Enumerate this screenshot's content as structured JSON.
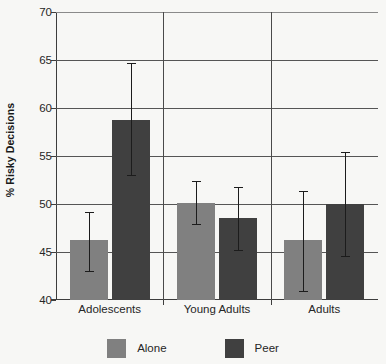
{
  "chart_data": {
    "type": "bar",
    "title": "",
    "xlabel": "",
    "ylabel": "% Risky Decisions",
    "ylim": [
      40,
      70
    ],
    "yticks": [
      40,
      45,
      50,
      55,
      60,
      65,
      70
    ],
    "grid": true,
    "legend_position": "bottom",
    "categories": [
      "Adolescents",
      "Young Adults",
      "Adults"
    ],
    "series": [
      {
        "name": "Alone",
        "color": "#808080",
        "values": [
          46.2,
          50.1,
          46.2
        ],
        "err_low": [
          43.0,
          47.9,
          40.9
        ],
        "err_high": [
          49.2,
          52.4,
          51.4
        ]
      },
      {
        "name": "Peer",
        "color": "#404040",
        "values": [
          58.8,
          48.5,
          50.0
        ],
        "err_low": [
          53.0,
          45.2,
          44.6
        ],
        "err_high": [
          64.7,
          51.8,
          55.4
        ]
      }
    ]
  },
  "legend": {
    "items": [
      {
        "label": "Alone",
        "color": "#808080"
      },
      {
        "label": "Peer",
        "color": "#404040"
      }
    ]
  },
  "colors": {
    "background": "#f7f7f5",
    "axis": "#3d3d3d",
    "grid": "#555555",
    "error_bar": "#1c1c1c"
  }
}
